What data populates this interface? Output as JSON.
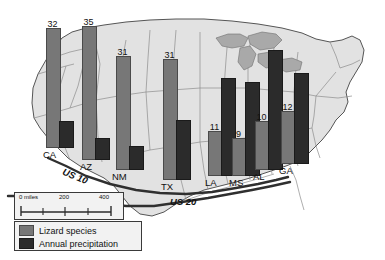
{
  "figure": {
    "background_color": "#ffffff"
  },
  "map": {
    "land_color": "#e2e2e2",
    "water_color": "#a9a9a9",
    "border_color": "#8c8c8c",
    "outline_color": "#555555",
    "highways": [
      {
        "name": "us-10",
        "label": "US 10"
      },
      {
        "name": "us-20",
        "label": "US 20"
      }
    ]
  },
  "scale_bar": {
    "zero_label": "0 miles",
    "mid_label": "200",
    "max_label": "400"
  },
  "legend": {
    "items": [
      {
        "label": "Lizard species",
        "color": "#777777"
      },
      {
        "label": "Annual precipitation",
        "color": "#2b2b2b"
      }
    ]
  },
  "chart_data": {
    "type": "bar",
    "xlabel": "",
    "ylabel": "",
    "grid": false,
    "legend_position": "bottom-left",
    "categories": [
      "CA",
      "AZ",
      "NM",
      "TX",
      "LA",
      "MS",
      "AL",
      "GA"
    ],
    "series": [
      {
        "name": "Lizard species",
        "color": "#777777",
        "values": [
          32,
          35,
          31,
          31,
          11,
          9,
          10,
          12
        ],
        "labels": [
          "32",
          "35",
          "31",
          "31",
          "11",
          "9",
          "10",
          "12"
        ]
      },
      {
        "name": "Annual precipitation",
        "color": "#2b2b2b",
        "values": [
          6,
          3,
          4,
          12,
          26,
          25,
          34,
          24
        ],
        "labels": [
          "",
          "",
          "",
          "",
          "",
          "",
          "",
          ""
        ]
      }
    ]
  },
  "bars": [
    {
      "state": "CA",
      "value_label": "32",
      "species_px": 118,
      "precip_px": 25,
      "left": 46,
      "baseline_top": 148,
      "label_left": 43,
      "label_top": 148
    },
    {
      "state": "AZ",
      "value_label": "35",
      "species_px": 132,
      "precip_px": 20,
      "left": 82,
      "baseline_top": 160,
      "label_left": 80,
      "label_top": 160
    },
    {
      "state": "NM",
      "value_label": "31",
      "species_px": 112,
      "precip_px": 22,
      "left": 116,
      "baseline_top": 170,
      "label_left": 112,
      "label_top": 170
    },
    {
      "state": "TX",
      "value_label": "31",
      "species_px": 119,
      "precip_px": 58,
      "left": 163,
      "baseline_top": 180,
      "label_left": 161,
      "label_top": 180
    },
    {
      "state": "LA",
      "value_label": "11",
      "species_px": 43,
      "precip_px": 96,
      "left": 208,
      "baseline_top": 176,
      "label_left": 205,
      "label_top": 176
    },
    {
      "state": "MS",
      "value_label": "9",
      "species_px": 36,
      "precip_px": 92,
      "left": 232,
      "baseline_top": 176,
      "label_left": 229,
      "label_top": 176
    },
    {
      "state": "AL",
      "value_label": "10",
      "species_px": 47,
      "precip_px": 118,
      "left": 255,
      "baseline_top": 170,
      "label_left": 253,
      "label_top": 170
    },
    {
      "state": "GA",
      "value_label": "12",
      "species_px": 51,
      "precip_px": 89,
      "left": 281,
      "baseline_top": 164,
      "label_left": 279,
      "label_top": 164
    }
  ]
}
